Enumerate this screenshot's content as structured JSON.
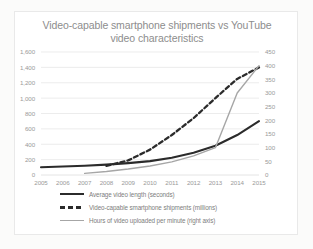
{
  "chart_data": {
    "type": "line",
    "title": "Video-capable smartphone shipments vs YouTube video characteristics",
    "title_line1": "Video-capable smartphone shipments vs YouTube",
    "title_line2": "video characteristics",
    "xlabel": "",
    "ylabel": "",
    "grid": true,
    "legend_position": "bottom",
    "categories": [
      "2005",
      "2006",
      "2007",
      "2008",
      "2009",
      "2010",
      "2011",
      "2012",
      "2013",
      "2014",
      "2015"
    ],
    "x": [
      2005,
      2006,
      2007,
      2008,
      2009,
      2010,
      2011,
      2012,
      2013,
      2014,
      2015
    ],
    "ylim": [
      0,
      1600
    ],
    "y2lim": [
      0,
      450
    ],
    "yticks": [
      "0",
      "200",
      "400",
      "600",
      "800",
      "1,000",
      "1,200",
      "1,400",
      "1,600"
    ],
    "ytick_values": [
      0,
      200,
      400,
      600,
      800,
      1000,
      1200,
      1400,
      1600
    ],
    "y2ticks": [
      "0",
      "50",
      "100",
      "150",
      "200",
      "250",
      "300",
      "350",
      "400",
      "450"
    ],
    "y2tick_values": [
      0,
      50,
      100,
      150,
      200,
      250,
      300,
      350,
      400,
      450
    ],
    "series": [
      {
        "name": "Average video length (seconds)",
        "axis": "left",
        "style": "solid-thick",
        "color": "#2b2b2b",
        "values": [
          100,
          110,
          120,
          135,
          155,
          180,
          225,
          290,
          380,
          520,
          700
        ]
      },
      {
        "name": "Video-capable smartphone shipments (millions)",
        "axis": "left",
        "style": "dashed",
        "color": "#2b2b2b",
        "values": [
          null,
          null,
          null,
          120,
          190,
          330,
          520,
          740,
          1000,
          1250,
          1400
        ]
      },
      {
        "name": "Hours of video uploaded per minute (right axis)",
        "axis": "right",
        "style": "solid-thin",
        "color": "#a6a6a6",
        "values": [
          null,
          null,
          6,
          13,
          22,
          33,
          48,
          70,
          100,
          300,
          400
        ]
      }
    ]
  },
  "legend": {
    "items": [
      {
        "label": "Average video length (seconds)",
        "key": "solid-thick-line-key"
      },
      {
        "label": "Video-capable smartphone shipments (millions)",
        "key": "dashed-line-key"
      },
      {
        "label": "Hours of video uploaded per minute (right axis)",
        "key": "thin-line-key"
      }
    ]
  },
  "colors": {
    "series_dark": "#2b2b2b",
    "series_gray": "#a6a6a6",
    "grid": "#e4e4e4",
    "text": "#9a9a9a",
    "title": "#8d8d8d",
    "background": "#ffffff",
    "page_background": "#fbfbfa"
  }
}
